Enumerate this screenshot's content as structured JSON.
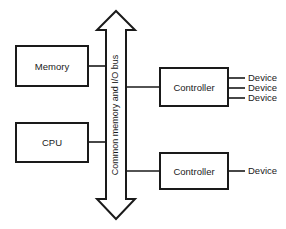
{
  "diagram": {
    "background_color": "#ffffff",
    "line_color": "#1a1a1a",
    "bus": {
      "label": "Common memory and I/O bus",
      "orientation": "vertical",
      "arrow_ends": "both",
      "top_arrow_name": "bus-arrow-up",
      "bottom_arrow_name": "bus-arrow-down"
    },
    "blocks": [
      {
        "id": "memory",
        "label": "Memory",
        "x": 16,
        "y": 46,
        "w": 72,
        "h": 40
      },
      {
        "id": "cpu",
        "label": "CPU",
        "x": 16,
        "y": 123,
        "w": 72,
        "h": 39
      },
      {
        "id": "controller-1",
        "label": "Controller",
        "x": 160,
        "y": 68,
        "w": 68,
        "h": 38
      },
      {
        "id": "controller-2",
        "label": "Controller",
        "x": 160,
        "y": 153,
        "w": 68,
        "h": 36
      }
    ],
    "devices": [
      {
        "id": "device-1",
        "label": "Device",
        "controller": "controller-1",
        "y": 78
      },
      {
        "id": "device-2",
        "label": "Device",
        "controller": "controller-1",
        "y": 88
      },
      {
        "id": "device-3",
        "label": "Device",
        "controller": "controller-1",
        "y": 98
      },
      {
        "id": "device-4",
        "label": "Device",
        "controller": "controller-2",
        "y": 171
      }
    ],
    "connections": [
      {
        "id": "memory-to-bus",
        "from": "memory",
        "to": "bus",
        "y": 66
      },
      {
        "id": "cpu-to-bus",
        "from": "cpu",
        "to": "bus",
        "y": 142
      },
      {
        "id": "bus-to-controller-1",
        "from": "bus",
        "to": "controller-1",
        "y": 87
      },
      {
        "id": "bus-to-controller-2",
        "from": "bus",
        "to": "controller-2",
        "y": 171
      }
    ]
  }
}
